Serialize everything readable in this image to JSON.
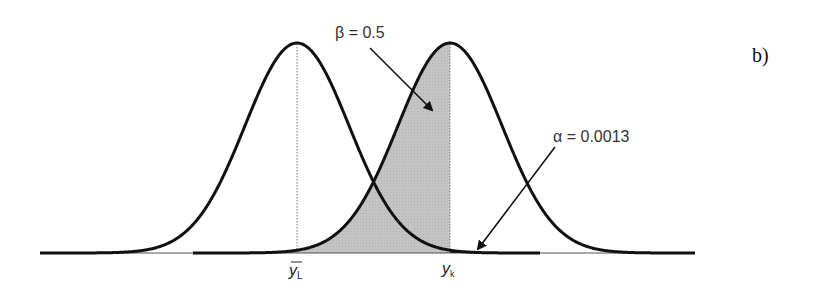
{
  "figure": {
    "panel_label": "b)",
    "beta_label": "β = 0.5",
    "alpha_label": "α = 0.0013",
    "x_tick_left_main": "y",
    "x_tick_left_sub": "L",
    "x_tick_right_main": "y",
    "x_tick_right_sub": "k"
  },
  "colors": {
    "curve": "#111111",
    "beta_fill": "#c4c4c4",
    "alpha_fill": "#000000",
    "baseline": "#555555",
    "guide": "#777777"
  },
  "chart_data": {
    "type": "area",
    "title": "",
    "series": [
      {
        "name": "left distribution (mean ȳL)",
        "mean_label": "ȳL"
      },
      {
        "name": "right distribution (mean yk)",
        "mean_label": "yk"
      }
    ],
    "annotations": [
      {
        "text": "β = 0.5",
        "region": "area under right curve, left of yk (shaded gray)"
      },
      {
        "text": "α = 0.0013",
        "region": "tail of left curve right of yk (filled black)"
      },
      {
        "text": "b)",
        "role": "panel label"
      }
    ],
    "x_ticks": [
      "ȳL",
      "yk"
    ],
    "grid": false,
    "legend": "none"
  }
}
